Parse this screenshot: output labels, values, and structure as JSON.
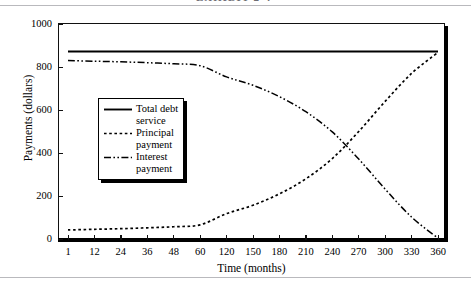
{
  "figure": {
    "title_cropped": "EXHIBIT 2-4",
    "background_color": "#ffffff",
    "line_color": "#000000"
  },
  "chart_data": {
    "type": "line",
    "title": "",
    "xlabel": "Time (months)",
    "ylabel": "Payments (dollars)",
    "categories": [
      "1",
      "12",
      "24",
      "36",
      "48",
      "60",
      "120",
      "150",
      "180",
      "210",
      "240",
      "270",
      "300",
      "330",
      "360"
    ],
    "x_tick_labels": [
      "1",
      "12",
      "24",
      "36",
      "48",
      "60",
      "120",
      "150",
      "180",
      "210",
      "240",
      "270",
      "300",
      "330",
      "360"
    ],
    "y_tick_labels": [
      "0",
      "200",
      "400",
      "600",
      "800",
      "1000"
    ],
    "y_ticks": [
      0,
      200,
      400,
      600,
      800,
      1000
    ],
    "ylim": [
      0,
      1000
    ],
    "grid": false,
    "legend_position": "center-left",
    "series": [
      {
        "name": "Total debt service",
        "style": "solid",
        "color": "#000000",
        "values": [
          872,
          872,
          872,
          872,
          872,
          872,
          872,
          872,
          872,
          872,
          872,
          872,
          872,
          872,
          872
        ]
      },
      {
        "name": "Principal payment",
        "style": "dotted",
        "color": "#000000",
        "values": [
          42,
          45,
          48,
          52,
          57,
          66,
          118,
          157,
          210,
          280,
          374,
          500,
          640,
          770,
          868
        ]
      },
      {
        "name": "Interest payment",
        "style": "dash-dot-dot",
        "color": "#000000",
        "values": [
          830,
          827,
          824,
          820,
          815,
          806,
          754,
          715,
          662,
          592,
          498,
          372,
          232,
          102,
          4
        ]
      }
    ],
    "annotations": [
      {
        "label": "crossover",
        "x": "285",
        "y": 437
      }
    ]
  },
  "legend": {
    "items": [
      {
        "label": "Total debt\nservice",
        "style": "solid"
      },
      {
        "label": "Principal\npayment",
        "style": "dotted"
      },
      {
        "label": "Interest\npayment",
        "style": "dash-dot-dot"
      }
    ]
  }
}
